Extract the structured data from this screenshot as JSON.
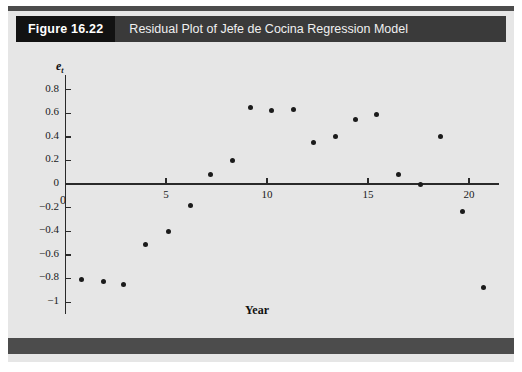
{
  "figure": {
    "number_label": "Figure 16.22",
    "title": "Residual Plot of Jefe de Cocina Regression Model"
  },
  "colors": {
    "plate_background": "#e6e6e6",
    "rule": "#4c4c4c",
    "caption_number_bg": "#121212",
    "caption_bar_bg": "#3a3a3a",
    "caption_text": "#f0f0f0",
    "axis": "#2a2a2a",
    "marker": "#1b1b1b"
  },
  "chart_data": {
    "type": "scatter",
    "title": "Residual Plot of Jefe de Cocina Regression Model",
    "xlabel": "Year",
    "ylabel": "e_t",
    "ylabel_display": "e",
    "ylabel_subscript": "t",
    "xlim": [
      0,
      21.5
    ],
    "ylim": [
      -1.1,
      0.92
    ],
    "xticks": [
      5,
      10,
      15,
      20
    ],
    "xticklabels": [
      "5",
      "10",
      "15",
      "20"
    ],
    "yticks": [
      0.8,
      0.6,
      0.4,
      0.2,
      0,
      -0.2,
      -0.4,
      -0.6,
      -0.8,
      -1
    ],
    "yticklabels": [
      "0.8",
      "0.6",
      "0.4",
      "0.2",
      "0",
      "-0.2",
      "-0.4",
      "-0.6",
      "-0.8",
      "-1"
    ],
    "origin_label": "0",
    "grid": false,
    "legend": false,
    "x": [
      0.8,
      1.9,
      2.9,
      4.0,
      5.1,
      6.2,
      7.2,
      8.3,
      9.2,
      10.2,
      11.3,
      12.3,
      13.4,
      14.4,
      15.4,
      16.5,
      17.6,
      18.6,
      19.7,
      20.7
    ],
    "y": [
      -0.81,
      -0.83,
      -0.85,
      -0.51,
      -0.4,
      -0.18,
      0.08,
      0.2,
      0.65,
      0.62,
      0.63,
      0.35,
      0.4,
      0.55,
      0.59,
      0.08,
      0.0,
      0.4,
      -0.23,
      -0.88
    ],
    "points": [
      {
        "x": 0.8,
        "y": -0.81
      },
      {
        "x": 1.9,
        "y": -0.83
      },
      {
        "x": 2.9,
        "y": -0.85
      },
      {
        "x": 4.0,
        "y": -0.51
      },
      {
        "x": 5.1,
        "y": -0.4
      },
      {
        "x": 6.2,
        "y": -0.18
      },
      {
        "x": 7.2,
        "y": 0.08
      },
      {
        "x": 8.3,
        "y": 0.2
      },
      {
        "x": 9.2,
        "y": 0.65
      },
      {
        "x": 10.2,
        "y": 0.62
      },
      {
        "x": 11.3,
        "y": 0.63
      },
      {
        "x": 12.3,
        "y": 0.35
      },
      {
        "x": 13.4,
        "y": 0.4
      },
      {
        "x": 14.4,
        "y": 0.55
      },
      {
        "x": 15.4,
        "y": 0.59
      },
      {
        "x": 16.5,
        "y": 0.08
      },
      {
        "x": 17.6,
        "y": 0.0
      },
      {
        "x": 18.6,
        "y": 0.4
      },
      {
        "x": 19.7,
        "y": -0.23
      },
      {
        "x": 20.7,
        "y": -0.88
      }
    ]
  }
}
